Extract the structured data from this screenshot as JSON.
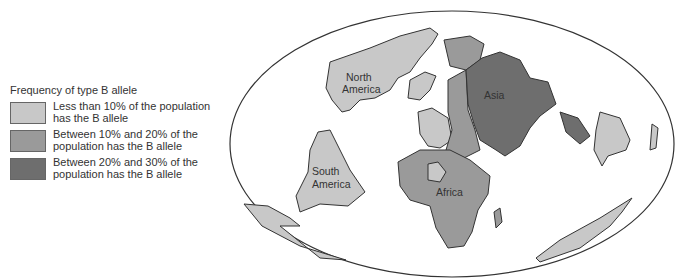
{
  "legend": {
    "title": "Frequency of type B allele",
    "items": [
      {
        "label": "Less than 10% of the population has the B allele",
        "color": "#c8c8c8"
      },
      {
        "label": "Between 10% and 20% of the population has the B allele",
        "color": "#9a9a9a"
      },
      {
        "label": "Between 20% and 30% of the population has the B allele",
        "color": "#6e6e6e"
      }
    ]
  },
  "map": {
    "labels": {
      "north_america": [
        "North",
        "America"
      ],
      "south_america": [
        "South",
        "America"
      ],
      "africa": "Africa",
      "asia": "Asia"
    }
  }
}
